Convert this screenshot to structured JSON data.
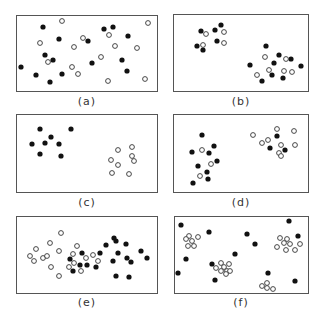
{
  "figure": {
    "colors": {
      "filled": "#111111",
      "open_stroke": "#333333",
      "border": "#555555"
    },
    "panels": [
      {
        "label": "(a)",
        "box": [
          16,
          15,
          142,
          77
        ],
        "caption_pos": [
          87,
          102
        ],
        "filled": [
          [
            43,
            27
          ],
          [
            59,
            39
          ],
          [
            104,
            29
          ],
          [
            113,
            27
          ],
          [
            128,
            36
          ],
          [
            88,
            41
          ],
          [
            45,
            55
          ],
          [
            53,
            60
          ],
          [
            21,
            67
          ],
          [
            36,
            75
          ],
          [
            50,
            82
          ],
          [
            62,
            74
          ],
          [
            92,
            63
          ],
          [
            122,
            60
          ],
          [
            127,
            71
          ]
        ],
        "open": [
          [
            62,
            21
          ],
          [
            148,
            23
          ],
          [
            40,
            43
          ],
          [
            83,
            38
          ],
          [
            74,
            47
          ],
          [
            109,
            35
          ],
          [
            115,
            46
          ],
          [
            137,
            48
          ],
          [
            48,
            62
          ],
          [
            101,
            57
          ],
          [
            72,
            67
          ],
          [
            78,
            74
          ],
          [
            108,
            81
          ],
          [
            145,
            79
          ]
        ]
      },
      {
        "label": "(b)",
        "box": [
          173,
          14,
          136,
          78
        ],
        "caption_pos": [
          241,
          102
        ],
        "filled": [
          [
            201,
            31
          ],
          [
            215,
            30
          ],
          [
            221,
            25
          ],
          [
            217,
            41
          ],
          [
            197,
            46
          ],
          [
            203,
            50
          ],
          [
            266,
            46
          ],
          [
            279,
            55
          ],
          [
            291,
            59
          ],
          [
            274,
            63
          ],
          [
            250,
            65
          ],
          [
            301,
            66
          ],
          [
            272,
            75
          ],
          [
            262,
            81
          ],
          [
            283,
            78
          ]
        ],
        "open": [
          [
            206,
            34
          ],
          [
            224,
            32
          ],
          [
            224,
            43
          ],
          [
            203,
            45
          ],
          [
            265,
            57
          ],
          [
            286,
            59
          ],
          [
            269,
            70
          ],
          [
            284,
            71
          ],
          [
            292,
            72
          ],
          [
            257,
            75
          ]
        ]
      },
      {
        "label": "(c)",
        "box": [
          16,
          114,
          142,
          79
        ],
        "caption_pos": [
          87,
          203
        ],
        "filled": [
          [
            40,
            129
          ],
          [
            71,
            129
          ],
          [
            51,
            137
          ],
          [
            32,
            144
          ],
          [
            45,
            143
          ],
          [
            59,
            144
          ],
          [
            40,
            154
          ],
          [
            61,
            156
          ]
        ],
        "open": [
          [
            118,
            150
          ],
          [
            132,
            147
          ],
          [
            132,
            156
          ],
          [
            111,
            160
          ],
          [
            134,
            161
          ],
          [
            118,
            165
          ],
          [
            112,
            173
          ],
          [
            129,
            174
          ]
        ]
      },
      {
        "label": "(d)",
        "box": [
          173,
          114,
          136,
          79
        ],
        "caption_pos": [
          241,
          203
        ],
        "filled": [
          [
            202,
            135
          ],
          [
            214,
            146
          ],
          [
            192,
            152
          ],
          [
            209,
            153
          ],
          [
            217,
            161
          ],
          [
            198,
            166
          ],
          [
            207,
            172
          ],
          [
            208,
            179
          ],
          [
            193,
            183
          ],
          [
            277,
            136
          ],
          [
            270,
            148
          ],
          [
            285,
            150
          ]
        ],
        "open": [
          [
            202,
            150
          ],
          [
            211,
            164
          ],
          [
            200,
            176
          ],
          [
            253,
            135
          ],
          [
            277,
            129
          ],
          [
            294,
            131
          ],
          [
            262,
            143
          ],
          [
            268,
            140
          ],
          [
            281,
            145
          ],
          [
            295,
            145
          ],
          [
            279,
            153
          ],
          [
            281,
            156
          ]
        ]
      },
      {
        "label": "(e)",
        "box": [
          16,
          216,
          142,
          78
        ],
        "caption_pos": [
          87,
          303
        ],
        "filled": [
          [
            114,
            238
          ],
          [
            116,
            241
          ],
          [
            126,
            244
          ],
          [
            106,
            245
          ],
          [
            82,
            253
          ],
          [
            100,
            253
          ],
          [
            118,
            253
          ],
          [
            70,
            259
          ],
          [
            80,
            265
          ],
          [
            87,
            265
          ],
          [
            96,
            267
          ],
          [
            73,
            271
          ],
          [
            113,
            261
          ],
          [
            127,
            258
          ],
          [
            131,
            262
          ],
          [
            141,
            251
          ],
          [
            147,
            258
          ],
          [
            116,
            276
          ],
          [
            129,
            277
          ]
        ],
        "open": [
          [
            61,
            233
          ],
          [
            36,
            249
          ],
          [
            50,
            243
          ],
          [
            30,
            256
          ],
          [
            34,
            261
          ],
          [
            43,
            258
          ],
          [
            47,
            256
          ],
          [
            59,
            251
          ],
          [
            77,
            246
          ],
          [
            73,
            254
          ],
          [
            51,
            267
          ],
          [
            59,
            276
          ],
          [
            86,
            258
          ],
          [
            93,
            255
          ],
          [
            74,
            263
          ],
          [
            69,
            267
          ],
          [
            81,
            271
          ],
          [
            98,
            261
          ]
        ]
      },
      {
        "label": "(f)",
        "box": [
          174,
          216,
          135,
          78
        ],
        "caption_pos": [
          241,
          303
        ],
        "filled": [
          [
            181,
            225
          ],
          [
            209,
            232
          ],
          [
            247,
            234
          ],
          [
            255,
            244
          ],
          [
            289,
            221
          ],
          [
            298,
            236
          ],
          [
            186,
            259
          ],
          [
            235,
            254
          ],
          [
            212,
            264
          ],
          [
            178,
            273
          ],
          [
            215,
            280
          ],
          [
            268,
            273
          ],
          [
            295,
            281
          ]
        ],
        "open": [
          [
            189,
            236
          ],
          [
            186,
            239
          ],
          [
            198,
            237
          ],
          [
            192,
            241
          ],
          [
            188,
            246
          ],
          [
            194,
            246
          ],
          [
            221,
            263
          ],
          [
            229,
            264
          ],
          [
            216,
            268
          ],
          [
            224,
            267
          ],
          [
            221,
            271
          ],
          [
            227,
            271
          ],
          [
            230,
            271
          ],
          [
            226,
            274
          ],
          [
            280,
            238
          ],
          [
            287,
            239
          ],
          [
            284,
            243
          ],
          [
            290,
            244
          ],
          [
            277,
            247
          ],
          [
            286,
            250
          ],
          [
            295,
            250
          ],
          [
            300,
            244
          ],
          [
            267,
            283
          ],
          [
            262,
            286
          ],
          [
            267,
            288
          ],
          [
            273,
            289
          ]
        ]
      }
    ]
  }
}
